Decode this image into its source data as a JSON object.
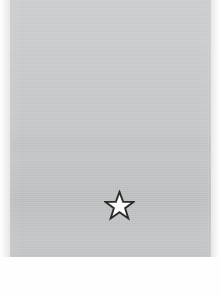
{
  "document": {
    "kind": "scanned-paper-fragment",
    "background_color": "#ffffff",
    "field_color": "#c9cacb",
    "field_edge_color": "#e6e7e7",
    "field_left": 10,
    "field_top": 0,
    "field_width": 201,
    "field_height": 257
  },
  "marks": {
    "star": {
      "name": "five-pointed-star",
      "fill_color": "#fbfbfb",
      "stroke_color": "#2b2b2b",
      "center_x": 119,
      "center_y": 205,
      "width": 31,
      "height": 31,
      "points": 5,
      "label": ""
    }
  },
  "bands": [
    {
      "name": "upper-light-band",
      "y_start": 0,
      "y_end": 140,
      "tone": "light"
    },
    {
      "name": "mid-band",
      "y_start": 140,
      "y_end": 165,
      "tone": "medium"
    },
    {
      "name": "lower-dark-band",
      "y_start": 185,
      "y_end": 220,
      "tone": "darker"
    },
    {
      "name": "bottom-band",
      "y_start": 220,
      "y_end": 257,
      "tone": "medium"
    }
  ]
}
